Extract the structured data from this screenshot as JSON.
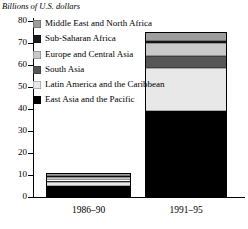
{
  "chart_data": {
    "type": "bar",
    "subtype": "stacked-bar",
    "title": "",
    "ylabel": "Billions of U.S. dollars",
    "xlabel": "",
    "ylim": [
      0,
      80
    ],
    "yticks": [
      0,
      10,
      20,
      30,
      40,
      50,
      60,
      70,
      80
    ],
    "ytick_labels": [
      "0",
      "10",
      "20",
      "30",
      "40",
      "50",
      "60",
      "70",
      "80"
    ],
    "grid": false,
    "legend_position": "top-left",
    "categories": [
      "1986–90",
      "1991–95"
    ],
    "series": [
      {
        "name": "East Asia and the Pacific",
        "key": "eap",
        "color": "#000000",
        "values": [
          5.0,
          39.0
        ]
      },
      {
        "name": "Latin America and the Caribbean",
        "key": "lac",
        "color": "#e8e8e8",
        "values": [
          1.8,
          19.5
        ]
      },
      {
        "name": "South Asia",
        "key": "sa",
        "color": "#565656",
        "values": [
          0.7,
          5.5
        ]
      },
      {
        "name": "Europe and Central Asia",
        "key": "eca",
        "color": "#c9c9c9",
        "values": [
          1.4,
          6.0
        ]
      },
      {
        "name": "Sub-Saharan Africa",
        "key": "ssa",
        "color": "#1b1b1b",
        "values": [
          0.5,
          0.8
        ]
      },
      {
        "name": "Middle East and North Africa",
        "key": "mena",
        "color": "#9d9d9d",
        "values": [
          1.6,
          4.2
        ]
      }
    ],
    "totals": [
      11.0,
      75.0
    ]
  },
  "legend": {
    "items": [
      {
        "label": "Middle East and North Africa",
        "key": "mena"
      },
      {
        "label": "Sub-Saharan Africa",
        "key": "ssa"
      },
      {
        "label": "Europe and Central Asia",
        "key": "eca"
      },
      {
        "label": "South Asia",
        "key": "sa"
      },
      {
        "label": "Latin America and the Caribbean",
        "key": "lac"
      },
      {
        "label": "East Asia and the Pacific",
        "key": "eap"
      }
    ]
  }
}
